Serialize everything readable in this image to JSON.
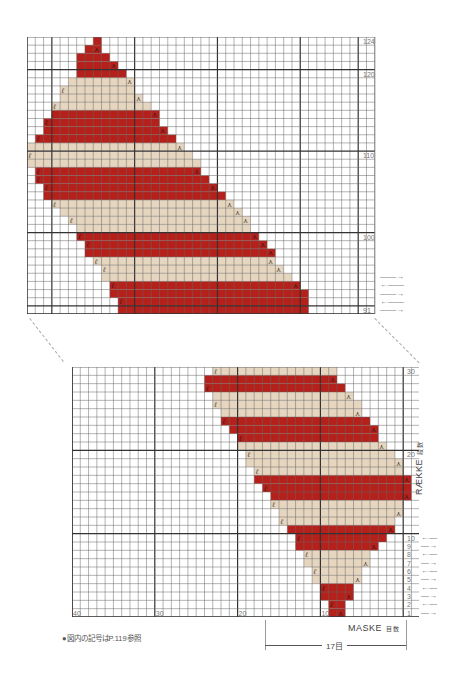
{
  "colors": {
    "red": "#b5201a",
    "beige": "#e6d6c0",
    "grid": "#555555",
    "bg": "#ffffff"
  },
  "top_chart": {
    "rows_from": 91,
    "rows_to": 124,
    "row_labels": [
      {
        "row": 124,
        "text": "124"
      },
      {
        "row": 120,
        "text": "120"
      },
      {
        "row": 110,
        "text": "110"
      },
      {
        "row": 100,
        "text": "100"
      },
      {
        "row": 91,
        "text": "91"
      }
    ],
    "arrows": [
      "→",
      "←",
      "→",
      "←",
      "→"
    ]
  },
  "bottom_chart": {
    "rows_from": 1,
    "rows_to": 30,
    "row_labels": [
      {
        "row": 30,
        "text": "30"
      },
      {
        "row": 20,
        "text": "20"
      },
      {
        "row": 10,
        "text": "10"
      },
      {
        "row": 9,
        "text": "9"
      },
      {
        "row": 8,
        "text": "8"
      },
      {
        "row": 7,
        "text": "7"
      },
      {
        "row": 6,
        "text": "6"
      },
      {
        "row": 5,
        "text": "5"
      },
      {
        "row": 4,
        "text": "4"
      },
      {
        "row": 3,
        "text": "3"
      },
      {
        "row": 2,
        "text": "2"
      },
      {
        "row": 1,
        "text": "1"
      }
    ],
    "col_labels": [
      {
        "col": 40,
        "text": "40"
      },
      {
        "col": 30,
        "text": "30"
      },
      {
        "col": 20,
        "text": "20"
      },
      {
        "col": 10,
        "text": "10"
      }
    ],
    "arrows": [
      "←",
      "→",
      "←",
      "→",
      "←",
      "→",
      "←",
      "→",
      "←",
      "→"
    ]
  },
  "labels": {
    "raekke": "RÆKKE",
    "raekke_jp": "段数",
    "maske": "MASKE",
    "maske_jp": "目数",
    "stitch_count": "17目",
    "note": "●図内の記号はP.119参照"
  }
}
